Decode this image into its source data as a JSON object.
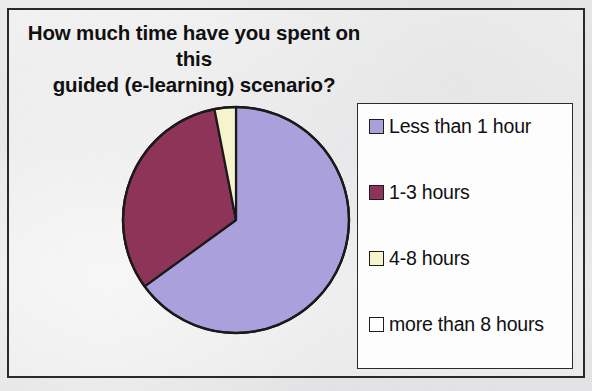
{
  "chart_data": {
    "type": "pie",
    "title": "How much time have you spent on this guided (e-learning) scenario?",
    "title_line1": "How much time have you spent on this",
    "title_line2": "guided (e-learning) scenario?",
    "categories": [
      "Less than 1 hour",
      "1-3 hours",
      "4-8 hours",
      "more than 8 hours"
    ],
    "values": [
      65,
      32,
      3,
      0
    ],
    "unit": "percent",
    "colors": [
      "#a9a0dc",
      "#8e3459",
      "#f5f4cd",
      "#ffffff"
    ],
    "legend_position": "right",
    "grid": false,
    "start_angle_deg": 0,
    "direction": "clockwise",
    "slices": [
      {
        "label": "Less than 1 hour",
        "value": 65,
        "color": "#a9a0dc",
        "start_deg": 0,
        "end_deg": 234
      },
      {
        "label": "1-3 hours",
        "value": 32,
        "color": "#8e3459",
        "start_deg": 234,
        "end_deg": 349
      },
      {
        "label": "4-8 hours",
        "value": 3,
        "color": "#f5f4cd",
        "start_deg": 349,
        "end_deg": 360
      },
      {
        "label": "more than 8 hours",
        "value": 0,
        "color": "#ffffff",
        "start_deg": 360,
        "end_deg": 360
      }
    ]
  },
  "legend": {
    "items": [
      {
        "label": "Less than 1 hour",
        "color": "#a9a0dc"
      },
      {
        "label": "1-3 hours",
        "color": "#8e3459"
      },
      {
        "label": "4-8 hours",
        "color": "#f5f4cd"
      },
      {
        "label": "more than 8 hours",
        "color": "#ffffff"
      }
    ]
  },
  "ghost_text": {
    "line1": "in",
    "line2": "ing",
    "line3": "a vanis"
  }
}
